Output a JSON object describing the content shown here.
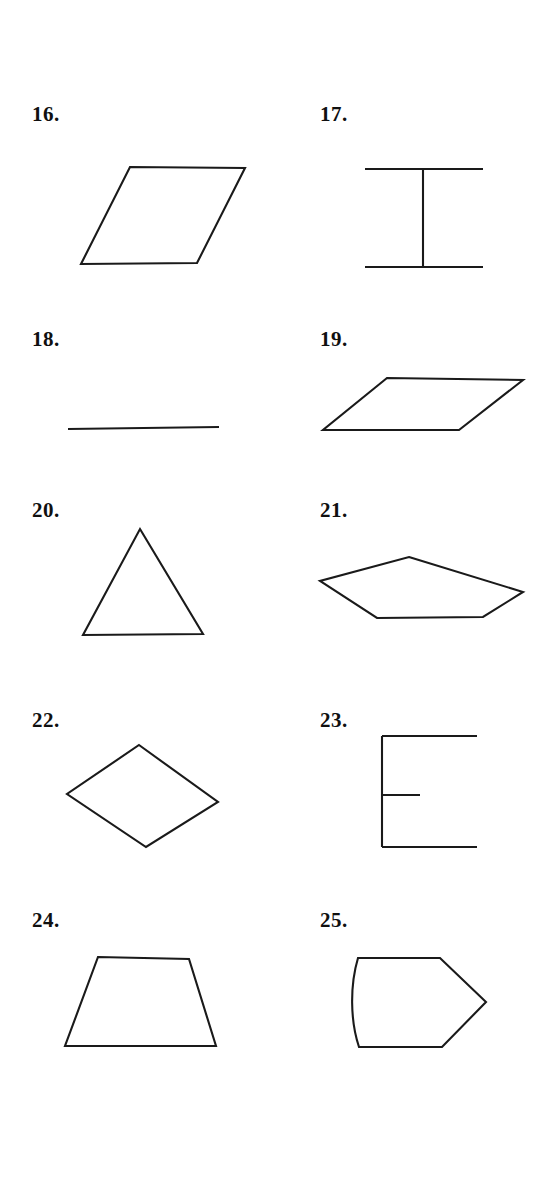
{
  "page": {
    "background_color": "#ffffff",
    "ink_color": "#1a1a1a",
    "width": 535,
    "height": 1178
  },
  "figures": [
    {
      "number": "16.",
      "label_x": 32,
      "label_y": 112,
      "shape_name": "parallelogram",
      "closed": true,
      "points": "130,167 245,168 197,263 81,264"
    },
    {
      "number": "17.",
      "label_x": 320,
      "label_y": 112,
      "shape_name": "i-beam",
      "closed": false,
      "segments": [
        "365,169 483,169",
        "365,267 483,267",
        "423,169 423,267"
      ]
    },
    {
      "number": "18.",
      "label_x": 32,
      "label_y": 337,
      "shape_name": "line-segment",
      "closed": false,
      "segments": [
        "68,429 219,427"
      ]
    },
    {
      "number": "19.",
      "label_x": 320,
      "label_y": 337,
      "shape_name": "flat-parallelogram",
      "closed": true,
      "points": "387,378 523,380 459,430 323,430"
    },
    {
      "number": "20.",
      "label_x": 32,
      "label_y": 508,
      "shape_name": "triangle",
      "closed": true,
      "points": "140,529 203,634 83,635"
    },
    {
      "number": "21.",
      "label_x": 320,
      "label_y": 508,
      "shape_name": "pentagon",
      "closed": true,
      "points": "409,557 523,592 483,617 377,618 320,581"
    },
    {
      "number": "22.",
      "label_x": 32,
      "label_y": 718,
      "shape_name": "rhombus",
      "closed": true,
      "points": "139,745 218,802 146,847 67,794"
    },
    {
      "number": "23.",
      "label_x": 320,
      "label_y": 718,
      "shape_name": "letter-e-outline",
      "closed": false,
      "segments": [
        "382,736 382,847",
        "382,736 477,736",
        "382,795 420,795",
        "382,847 477,847"
      ]
    },
    {
      "number": "24.",
      "label_x": 32,
      "label_y": 918,
      "shape_name": "trapezoid",
      "closed": true,
      "points": "98,957 189,959 216,1046 65,1046"
    },
    {
      "number": "25.",
      "label_x": 320,
      "label_y": 918,
      "shape_name": "bullet-pentagon-curved-left",
      "closed": false,
      "path": "M 358,958 L 440,958 L 486,1002 L 442,1047 L 359,1047 C 350,1020 350,985 358,958 Z"
    }
  ]
}
